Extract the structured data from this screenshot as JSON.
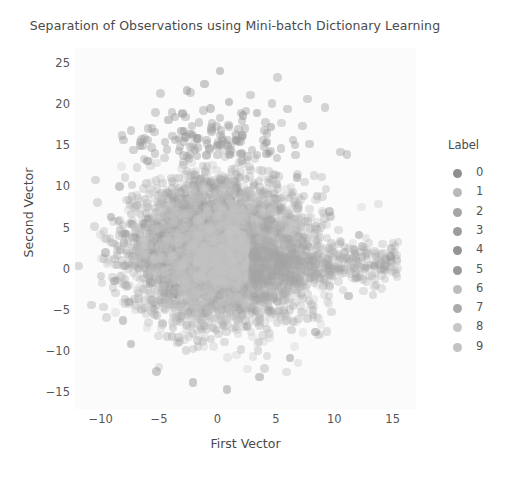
{
  "chart_data": {
    "type": "scatter",
    "title": "Separation of Observations using Mini-batch Dictionary Learning",
    "xlabel": "First Vector",
    "ylabel": "Second Vector",
    "xlim": [
      -12.2,
      17.0
    ],
    "ylim": [
      -17.0,
      27.0
    ],
    "xticks": [
      -10,
      -5,
      0,
      5,
      10,
      15
    ],
    "xticklabels": [
      "−10",
      "−5",
      "0",
      "5",
      "10",
      "15"
    ],
    "yticks": [
      -15,
      -10,
      -5,
      0,
      5,
      10,
      15,
      20,
      25
    ],
    "yticklabels": [
      "−15",
      "−10",
      "−5",
      "0",
      "5",
      "10",
      "15",
      "20",
      "25"
    ],
    "grid": false,
    "panel_background": "#fbfbfb",
    "marker_size_px": 8.5,
    "marker_opacity": 0.3,
    "legend": {
      "title": "Label",
      "position": "right",
      "entries": [
        {
          "label": "0",
          "color": "#8f8f8f"
        },
        {
          "label": "1",
          "color": "#b9b9b9"
        },
        {
          "label": "2",
          "color": "#a6a6a6"
        },
        {
          "label": "3",
          "color": "#9d9d9d"
        },
        {
          "label": "4",
          "color": "#949494"
        },
        {
          "label": "5",
          "color": "#9a9a9a"
        },
        {
          "label": "6",
          "color": "#bdbdbd"
        },
        {
          "label": "7",
          "color": "#ababab"
        },
        {
          "label": "8",
          "color": "#c6c6c6"
        },
        {
          "label": "9",
          "color": "#c2c2c2"
        }
      ]
    },
    "series": [
      {
        "name": "0",
        "color": "#8f8f8f",
        "n": 520,
        "cx": -0.3,
        "cy": 2.6,
        "sx": 3.4,
        "sy": 4.2,
        "rot": 0.15
      },
      {
        "name": "1",
        "color": "#b9b9b9",
        "n": 560,
        "cx": 1.2,
        "cy": 1.8,
        "sx": 3.8,
        "sy": 3.9,
        "rot": -0.1
      },
      {
        "name": "2",
        "color": "#a6a6a6",
        "n": 520,
        "cx": -0.8,
        "cy": 2.2,
        "sx": 3.2,
        "sy": 4.0,
        "rot": 0.25
      },
      {
        "name": "3",
        "color": "#9d9d9d",
        "n": 530,
        "cx": 0.6,
        "cy": 2.9,
        "sx": 3.6,
        "sy": 4.3,
        "rot": 0.05
      },
      {
        "name": "4",
        "color": "#949494",
        "n": 520,
        "cx": -0.5,
        "cy": 1.6,
        "sx": 3.3,
        "sy": 3.8,
        "rot": 0.2
      },
      {
        "name": "5",
        "color": "#9a9a9a",
        "n": 500,
        "cx": 0.9,
        "cy": 2.4,
        "sx": 3.7,
        "sy": 4.1,
        "rot": -0.18
      },
      {
        "name": "6",
        "color": "#bdbdbd",
        "n": 540,
        "cx": 0.2,
        "cy": 1.9,
        "sx": 3.5,
        "sy": 4.0,
        "rot": 0.12
      },
      {
        "name": "7",
        "color": "#ababab",
        "n": 520,
        "cx": -0.1,
        "cy": 2.7,
        "sx": 3.4,
        "sy": 4.2,
        "rot": -0.06
      },
      {
        "name": "8",
        "color": "#c6c6c6",
        "n": 510,
        "cx": 1.4,
        "cy": 1.5,
        "sx": 3.9,
        "sy": 3.7,
        "rot": 0.22
      },
      {
        "name": "9",
        "color": "#c2c2c2",
        "n": 530,
        "cx": -0.4,
        "cy": 2.1,
        "sx": 3.3,
        "sy": 4.1,
        "rot": 0.08
      }
    ],
    "tail": {
      "name": "right-tail",
      "color": "#a3a3a3",
      "n": 430,
      "x0": 3.0,
      "x1": 15.5,
      "cy": 0.6,
      "sy": 2.3
    },
    "outliers": {
      "name": "upper-outliers",
      "color": "#9b9b9b",
      "n": 120,
      "cx": 0.0,
      "cy": 13.5,
      "sx": 4.0,
      "sy": 3.4
    }
  }
}
